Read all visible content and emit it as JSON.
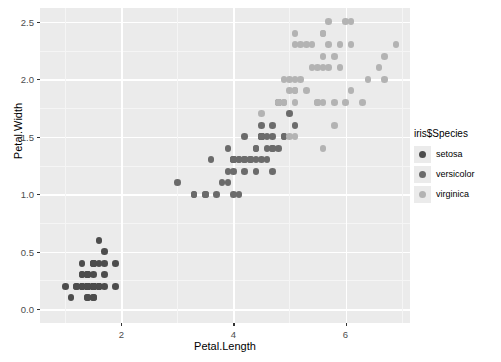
{
  "chart_data": {
    "type": "scatter",
    "title": "",
    "xlabel": "Petal.Length",
    "ylabel": "Petal.Width",
    "xlim": [
      0.55,
      7.15
    ],
    "ylim": [
      -0.12,
      2.62
    ],
    "xticks": [
      "2",
      "4",
      "6"
    ],
    "xtick_values": [
      2,
      4,
      6
    ],
    "yticks": [
      "0.0",
      "0.5",
      "1.0",
      "1.5",
      "2.0",
      "2.5"
    ],
    "ytick_values": [
      0.0,
      0.5,
      1.0,
      1.5,
      2.0,
      2.5
    ],
    "grid": true,
    "legend_position": "right",
    "legend_title": "iris$Species",
    "panel_background": "#ebebeb",
    "grid_color": "#ffffff",
    "series": [
      {
        "name": "setosa",
        "color": "#4d4d4d",
        "x": [
          1.4,
          1.4,
          1.3,
          1.5,
          1.4,
          1.7,
          1.4,
          1.5,
          1.4,
          1.5,
          1.5,
          1.6,
          1.4,
          1.1,
          1.2,
          1.5,
          1.3,
          1.4,
          1.7,
          1.5,
          1.7,
          1.5,
          1.0,
          1.7,
          1.9,
          1.6,
          1.6,
          1.5,
          1.4,
          1.6,
          1.6,
          1.5,
          1.5,
          1.4,
          1.5,
          1.2,
          1.3,
          1.4,
          1.3,
          1.5,
          1.3,
          1.3,
          1.3,
          1.6,
          1.9,
          1.4,
          1.6,
          1.4,
          1.5,
          1.4
        ],
        "y": [
          0.2,
          0.2,
          0.2,
          0.2,
          0.2,
          0.4,
          0.3,
          0.2,
          0.2,
          0.1,
          0.2,
          0.2,
          0.1,
          0.1,
          0.2,
          0.4,
          0.4,
          0.3,
          0.3,
          0.3,
          0.2,
          0.4,
          0.2,
          0.5,
          0.2,
          0.2,
          0.4,
          0.2,
          0.2,
          0.2,
          0.2,
          0.4,
          0.1,
          0.2,
          0.2,
          0.2,
          0.2,
          0.1,
          0.2,
          0.2,
          0.3,
          0.3,
          0.2,
          0.6,
          0.4,
          0.3,
          0.2,
          0.2,
          0.2,
          0.2
        ]
      },
      {
        "name": "versicolor",
        "color": "#6b6b6b",
        "x": [
          4.7,
          4.5,
          4.9,
          4.0,
          4.6,
          4.5,
          4.7,
          3.3,
          4.6,
          3.9,
          3.5,
          4.2,
          4.0,
          4.7,
          3.6,
          4.4,
          4.5,
          4.1,
          4.5,
          3.9,
          4.8,
          4.0,
          4.9,
          4.7,
          4.3,
          4.4,
          4.8,
          5.0,
          4.5,
          3.5,
          3.8,
          3.7,
          3.9,
          5.1,
          4.5,
          4.5,
          4.7,
          4.4,
          4.1,
          4.0,
          4.4,
          4.6,
          4.0,
          3.3,
          4.2,
          4.2,
          4.2,
          4.3,
          3.0,
          4.1
        ],
        "y": [
          1.4,
          1.5,
          1.5,
          1.3,
          1.5,
          1.3,
          1.6,
          1.0,
          1.3,
          1.4,
          1.0,
          1.5,
          1.0,
          1.4,
          1.3,
          1.4,
          1.5,
          1.0,
          1.5,
          1.1,
          1.8,
          1.3,
          1.5,
          1.2,
          1.3,
          1.4,
          1.4,
          1.7,
          1.5,
          1.0,
          1.1,
          1.0,
          1.2,
          1.6,
          1.5,
          1.6,
          1.5,
          1.3,
          1.3,
          1.3,
          1.2,
          1.4,
          1.2,
          1.0,
          1.3,
          1.2,
          1.3,
          1.3,
          1.1,
          1.3
        ]
      },
      {
        "name": "virginica",
        "color": "#b3b3b3",
        "x": [
          6.0,
          5.1,
          5.9,
          5.6,
          5.8,
          6.6,
          4.5,
          6.3,
          5.8,
          6.1,
          5.1,
          5.3,
          5.5,
          5.0,
          5.1,
          5.3,
          5.5,
          6.7,
          6.9,
          5.0,
          5.7,
          4.9,
          6.7,
          4.9,
          5.7,
          6.0,
          4.8,
          4.9,
          5.6,
          5.8,
          6.1,
          6.4,
          5.6,
          5.1,
          5.6,
          6.1,
          5.6,
          5.5,
          4.8,
          5.4,
          5.6,
          5.1,
          5.1,
          5.9,
          5.7,
          5.2,
          5.0,
          5.2,
          5.4,
          5.1
        ],
        "y": [
          2.5,
          1.9,
          2.1,
          1.8,
          2.2,
          2.1,
          1.7,
          1.8,
          1.8,
          2.5,
          2.0,
          1.9,
          2.1,
          2.0,
          2.4,
          2.3,
          1.8,
          2.2,
          2.3,
          1.5,
          2.3,
          2.0,
          2.0,
          1.8,
          2.1,
          1.8,
          1.8,
          1.8,
          2.1,
          1.6,
          1.9,
          2.0,
          2.2,
          1.5,
          1.4,
          2.3,
          2.4,
          1.8,
          1.8,
          2.1,
          2.4,
          2.3,
          1.9,
          2.3,
          2.5,
          2.3,
          1.9,
          2.0,
          2.3,
          1.8
        ]
      }
    ]
  },
  "legend": {
    "title": "iris$Species",
    "items": [
      {
        "label": "setosa",
        "color": "#4d4d4d"
      },
      {
        "label": "versicolor",
        "color": "#6b6b6b"
      },
      {
        "label": "virginica",
        "color": "#b3b3b3"
      }
    ]
  }
}
